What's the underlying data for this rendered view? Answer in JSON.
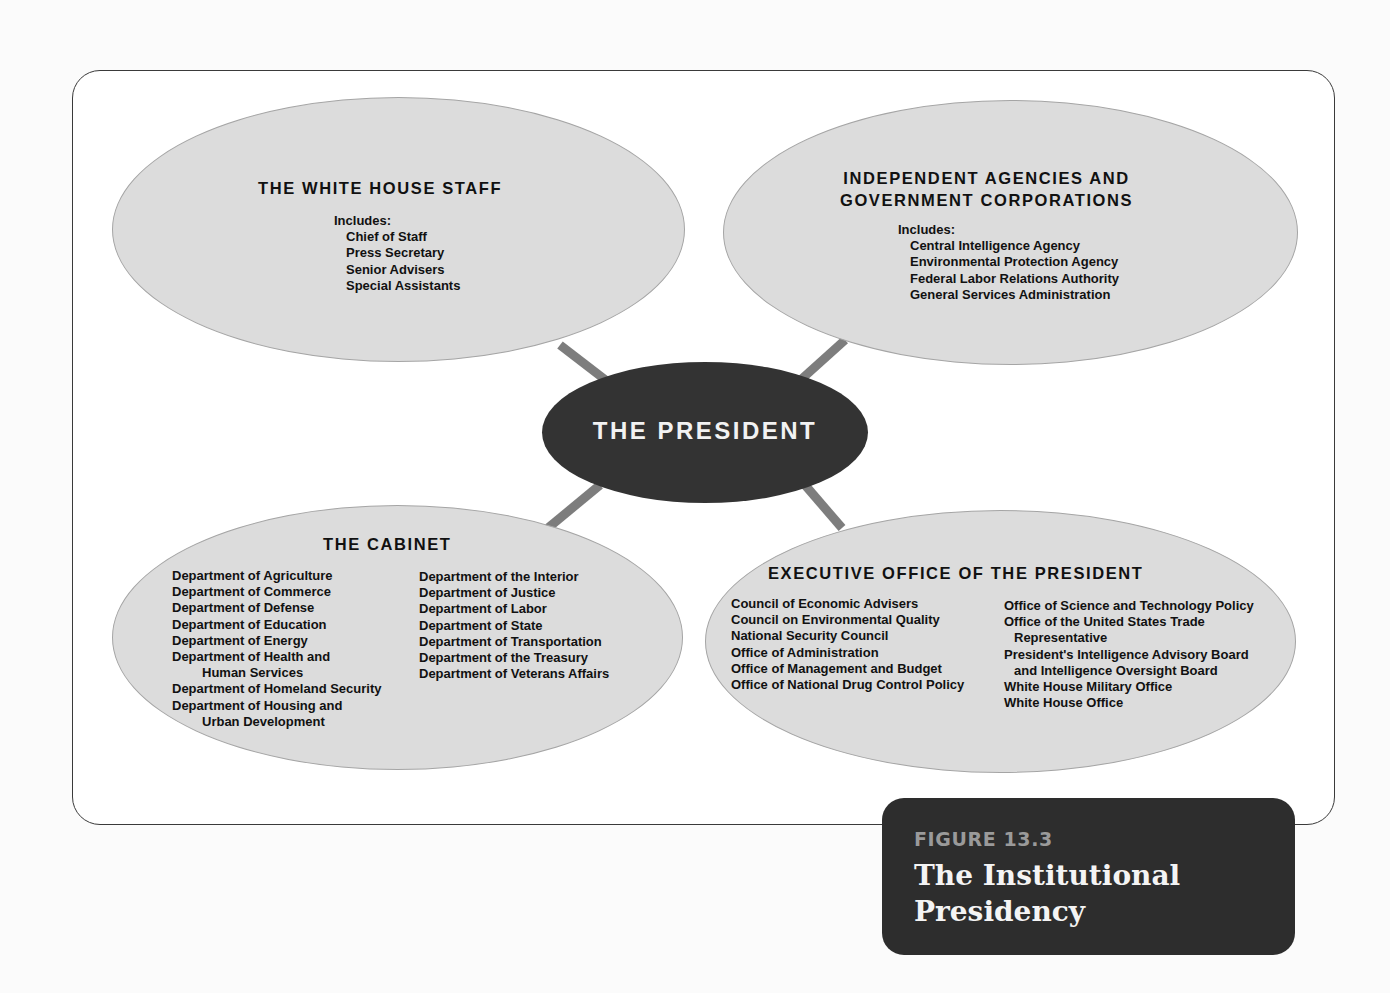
{
  "figure": {
    "number": "FIGURE 13.3",
    "title_line1": "The Institutional",
    "title_line2": "Presidency"
  },
  "center": {
    "label": "THE PRESIDENT"
  },
  "white_house_staff": {
    "title": "THE WHITE HOUSE STAFF",
    "includes_label": "Includes:",
    "items": [
      "Chief of Staff",
      "Press Secretary",
      "Senior Advisers",
      "Special Assistants"
    ]
  },
  "independent_agencies": {
    "title_line1": "INDEPENDENT AGENCIES AND",
    "title_line2": "GOVERNMENT CORPORATIONS",
    "includes_label": "Includes:",
    "items": [
      "Central Intelligence Agency",
      "Environmental Protection Agency",
      "Federal Labor Relations Authority",
      "General Services Administration"
    ]
  },
  "cabinet": {
    "title": "THE CABINET",
    "col1": [
      "Department of Agriculture",
      "Department of Commerce",
      "Department of Defense",
      "Department of Education",
      "Department of Energy",
      "Department of Health and",
      "Human Services",
      "Department of Homeland Security",
      "Department of Housing and",
      "Urban Development"
    ],
    "col2": [
      "Department of the Interior",
      "Department of Justice",
      "Department of Labor",
      "Department of State",
      "Department of Transportation",
      "Department of the Treasury",
      "Department of Veterans Affairs"
    ]
  },
  "executive_office": {
    "title": "EXECUTIVE OFFICE OF THE PRESIDENT",
    "col1": [
      "Council of Economic Advisers",
      "Council on Environmental Quality",
      "National Security Council",
      "Office of Administration",
      "Office of Management and Budget",
      "Office of National Drug Control Policy"
    ],
    "col2": [
      "Office of Science and Technology Policy",
      "Office of the United States Trade",
      "Representative",
      "President's Intelligence Advisory Board",
      "and Intelligence Oversight Board",
      "White House Military Office",
      "White House Office"
    ]
  },
  "colors": {
    "ellipse_fill": "#dcdcdc",
    "center_fill": "#333333",
    "connector": "#7d7d7d",
    "figure_box": "#2d2d2d"
  }
}
